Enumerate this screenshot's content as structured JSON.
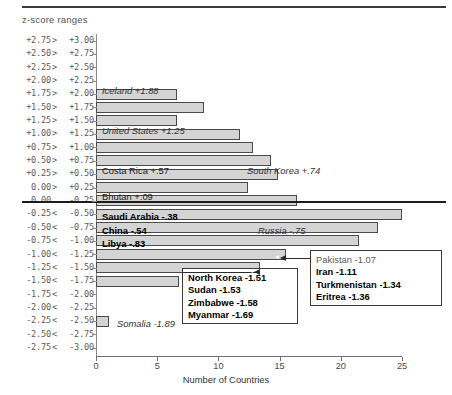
{
  "chart_data": {
    "type": "bar",
    "orientation": "horizontal",
    "title": "",
    "axis_title": "z-score ranges",
    "xlabel": "Number of Countries",
    "ylabel": "z-score ranges",
    "xlim": [
      0,
      25
    ],
    "xticks": [
      0,
      5,
      10,
      15,
      20,
      25
    ],
    "grid": false,
    "legend": "none",
    "zero_divider_after_category": "0.00> +0.25",
    "categories": [
      "+2.75> +3.00",
      "+2.50> +2.75",
      "+2.25> +2.50",
      "+2.00> +2.25",
      "+1.75> +2.00",
      "+1.50> +1.75",
      "+1.25> +1.50",
      "+1.00> +1.25",
      "+0.75> +1.00",
      "+0.50> +0.75",
      "+0.25> +0.50",
      "0.00> +0.25",
      "0.00  -0.25",
      "-0.25< -0.50",
      "-0.50< -0.75",
      "-0.75< -1.00",
      "-1.00< -1.25",
      "-1.25< -1.50",
      "-1.50< -1.75",
      "-1.75< -2.00",
      "-2.00< -2.25",
      "-2.25< -2.50",
      "-2.50< -2.75",
      "-2.75< -3.00"
    ],
    "category_parts": [
      [
        "+2.75",
        ">",
        "+3.00"
      ],
      [
        "+2.50",
        ">",
        "+2.75"
      ],
      [
        "+2.25",
        ">",
        "+2.50"
      ],
      [
        "+2.00",
        ">",
        "+2.25"
      ],
      [
        "+1.75",
        ">",
        "+2.00"
      ],
      [
        "+1.50",
        ">",
        "+1.75"
      ],
      [
        "+1.25",
        ">",
        "+1.50"
      ],
      [
        "+1.00",
        ">",
        "+1.25"
      ],
      [
        "+0.75",
        ">",
        "+1.00"
      ],
      [
        "+0.50",
        ">",
        "+0.75"
      ],
      [
        "+0.25",
        ">",
        "+0.50"
      ],
      [
        "0.00",
        ">",
        "+0.25"
      ],
      [
        "0.00",
        "",
        "-0.25"
      ],
      [
        "-0.25",
        "<",
        "-0.50"
      ],
      [
        "-0.50",
        "<",
        "-0.75"
      ],
      [
        "-0.75",
        "<",
        "-1.00"
      ],
      [
        "-1.00",
        "<",
        "-1.25"
      ],
      [
        "-1.25",
        "<",
        "-1.50"
      ],
      [
        "-1.50",
        "<",
        "-1.75"
      ],
      [
        "-1.75",
        "<",
        "-2.00"
      ],
      [
        "-2.00",
        "<",
        "-2.25"
      ],
      [
        "-2.25",
        "<",
        "-2.50"
      ],
      [
        "-2.50",
        "<",
        "-2.75"
      ],
      [
        "-2.75",
        "<",
        "-3.00"
      ]
    ],
    "values": [
      0,
      0,
      0,
      0,
      6.6,
      8.8,
      6.6,
      11.8,
      12.8,
      14.3,
      14.9,
      12.4,
      16.4,
      25.0,
      23.0,
      21.5,
      15.5,
      13.4,
      6.8,
      0,
      0,
      1.1,
      0,
      0
    ]
  },
  "bar_annotations": [
    {
      "text": "Iceland +1.88",
      "style": "italic",
      "category": "+1.75> +2.00",
      "x": 102,
      "y": 85
    },
    {
      "text": "United States +1.25",
      "style": "italic",
      "category": "+1.00> +1.25",
      "x": 102,
      "y": 125
    },
    {
      "text": "Costa Rica +.57",
      "style": "plain",
      "category": "+0.50> +0.75",
      "x": 102,
      "y": 165
    },
    {
      "text": "South Korea +.74",
      "style": "italic",
      "category": "+0.50> +0.75",
      "x": 247,
      "y": 165
    },
    {
      "text": "Bhutan +.09",
      "style": "plain",
      "category": "0.00> +0.25",
      "x": 102,
      "y": 191
    },
    {
      "text": "Saudi Arabia -.38",
      "style": "bold",
      "category": "-0.25< -0.50",
      "x": 102,
      "y": 211
    },
    {
      "text": "China -.54",
      "style": "bold",
      "category": "-0.50< -0.75",
      "x": 102,
      "y": 225
    },
    {
      "text": "Russia -.75",
      "style": "italic",
      "category": "-0.50< -0.75",
      "x": 258,
      "y": 225
    },
    {
      "text": "Libya -.83",
      "style": "bold",
      "category": "-0.75< -1.00",
      "x": 102,
      "y": 238
    },
    {
      "text": "Somalia -1.89",
      "style": "italic",
      "category": "-2.25< -2.50",
      "x": 117,
      "y": 318
    }
  ],
  "callouts": [
    {
      "name": "callout-north-korea-group",
      "lines": [
        {
          "text": "North Korea -1.51",
          "bold": true
        },
        {
          "text": "Sudan -1.53",
          "bold": true
        },
        {
          "text": "Zimbabwe -1.58",
          "bold": true
        },
        {
          "text": "Myanmar -1.69",
          "bold": true
        }
      ]
    },
    {
      "name": "callout-pakistan-group",
      "lines": [
        {
          "text": "Pakistan -1.07",
          "bold": false
        },
        {
          "text": "Iran -1.11",
          "bold": true
        },
        {
          "text": "Turkmenistan -1.34",
          "bold": true
        },
        {
          "text": "Eritrea -1.36",
          "bold": true
        }
      ]
    }
  ],
  "colors": {
    "bar_fill": "#d4d4d4",
    "bar_border": "#4a4a4a",
    "axis": "#6f6f6f",
    "zero_line": "#1c1c1c",
    "text": "#1a1a1a"
  }
}
